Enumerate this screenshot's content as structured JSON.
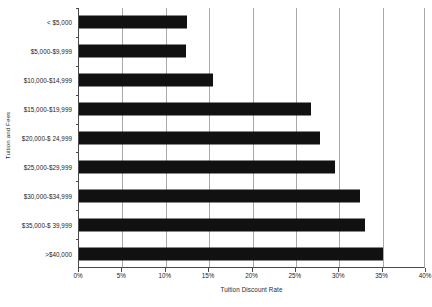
{
  "chart_data": {
    "type": "bar",
    "orientation": "horizontal",
    "title": "",
    "xlabel": "Tuition Discount Rate",
    "ylabel": "Tuition and Fees",
    "categories": [
      "< $5,000",
      "$5,000-$9,999",
      "$10,000-$14,999",
      "$15,000-$19,999",
      "$20,000-$ 24,999",
      "$25,000-$29,999",
      "$30,000-$34,999",
      "$35,000-$ 39,999",
      ">$40,000"
    ],
    "values": [
      12.5,
      12.3,
      15.5,
      26.8,
      27.8,
      29.5,
      32.4,
      33.0,
      35.1
    ],
    "xlim": [
      0,
      40
    ],
    "xticks": [
      0,
      5,
      10,
      15,
      20,
      25,
      30,
      35,
      40
    ],
    "xtick_labels": [
      "0%",
      "5%",
      "10%",
      "15%",
      "20%",
      "25%",
      "30%",
      "35%",
      "40%"
    ],
    "grid": "vertical",
    "legend": "none",
    "bar_color": "#111111",
    "grid_color": "#a9a9a9",
    "axis_color": "#4a4a4a"
  }
}
